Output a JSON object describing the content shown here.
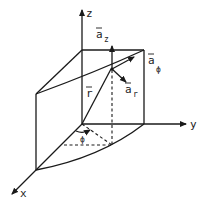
{
  "figure": {
    "axes": {
      "x": {
        "label": "x"
      },
      "y": {
        "label": "y"
      },
      "z": {
        "label": "z"
      }
    },
    "vectors": {
      "a_z": {
        "base": "a",
        "sub": "z"
      },
      "a_phi": {
        "base": "a",
        "sub": "ϕ"
      },
      "a_r": {
        "base": "a",
        "sub": "r"
      },
      "r": {
        "base": "r"
      }
    },
    "angle": {
      "label": "ϕ"
    },
    "colors": {
      "stroke": "#1a1a1a",
      "background": "#ffffff"
    }
  }
}
